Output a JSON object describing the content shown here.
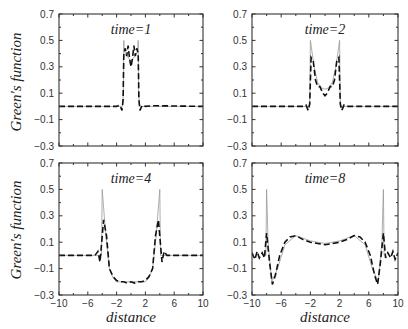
{
  "chart_data": [
    {
      "type": "line",
      "title": "time=1",
      "xlabel": "",
      "ylabel": "Green's function",
      "xlim": [
        -10,
        10
      ],
      "ylim": [
        -0.3,
        0.7
      ],
      "xticks": [
        -10,
        -6,
        -2,
        2,
        6,
        10
      ],
      "yticks": [
        -0.3,
        -0.1,
        0.1,
        0.3,
        0.5,
        0.7
      ],
      "show_xtick_labels": false,
      "show_ytick_labels": true,
      "series": [
        {
          "name": "exact",
          "style": "solid-thin",
          "x": [
            -10,
            -1.2,
            -1.05,
            -1.0,
            -0.95,
            -0.5,
            0,
            0.5,
            0.95,
            1.0,
            1.05,
            1.2,
            10
          ],
          "y": [
            0,
            0,
            0.1,
            0.5,
            0.42,
            0.38,
            0.34,
            0.38,
            0.42,
            0.5,
            0.1,
            0,
            0
          ]
        },
        {
          "name": "approximation",
          "style": "dashed",
          "x": [
            -10,
            -2,
            -1.6,
            -1.4,
            -1.25,
            -1.1,
            -1.0,
            -0.8,
            -0.6,
            -0.4,
            -0.2,
            0,
            0.2,
            0.4,
            0.6,
            0.8,
            1.0,
            1.1,
            1.25,
            1.4,
            1.6,
            2,
            3,
            10
          ],
          "y": [
            0,
            0,
            0.01,
            -0.01,
            -0.03,
            0.05,
            0.4,
            0.44,
            0.38,
            0.46,
            0.36,
            0.3,
            0.36,
            0.46,
            0.38,
            0.44,
            0.4,
            0.05,
            -0.03,
            -0.01,
            0.01,
            0,
            0.005,
            0
          ]
        }
      ]
    },
    {
      "type": "line",
      "title": "time=2",
      "xlabel": "",
      "ylabel": "",
      "xlim": [
        -10,
        10
      ],
      "ylim": [
        -0.3,
        0.7
      ],
      "xticks": [
        -10,
        -6,
        -2,
        2,
        6,
        10
      ],
      "yticks": [
        -0.3,
        -0.1,
        0.1,
        0.3,
        0.5,
        0.7
      ],
      "show_xtick_labels": false,
      "show_ytick_labels": true,
      "series": [
        {
          "name": "exact",
          "style": "solid-thin",
          "x": [
            -10,
            -2.1,
            -2.0,
            -1.5,
            -1,
            -0.5,
            0,
            0.5,
            1,
            1.5,
            2.0,
            2.1,
            10
          ],
          "y": [
            0,
            0,
            0.5,
            0.3,
            0.18,
            0.14,
            0.13,
            0.14,
            0.18,
            0.3,
            0.5,
            0,
            0
          ]
        },
        {
          "name": "approximation",
          "style": "dashed",
          "x": [
            -10,
            -3,
            -2.6,
            -2.3,
            -2.1,
            -1.9,
            -1.6,
            -1.3,
            -1,
            -0.7,
            -0.3,
            0,
            0.3,
            0.7,
            1,
            1.3,
            1.6,
            1.9,
            2.1,
            2.3,
            2.6,
            3,
            10
          ],
          "y": [
            0,
            0,
            0.01,
            -0.03,
            0.02,
            0.37,
            0.34,
            0.2,
            0.15,
            0.15,
            0.1,
            0.08,
            0.1,
            0.15,
            0.15,
            0.2,
            0.34,
            0.37,
            0.02,
            -0.03,
            0.01,
            0,
            0
          ]
        }
      ]
    },
    {
      "type": "line",
      "title": "time=4",
      "xlabel": "distance",
      "ylabel": "Green's function",
      "xlim": [
        -10,
        10
      ],
      "ylim": [
        -0.3,
        0.7
      ],
      "xticks": [
        -10,
        -6,
        -2,
        2,
        6,
        10
      ],
      "yticks": [
        -0.3,
        -0.1,
        0.1,
        0.3,
        0.5,
        0.7
      ],
      "show_xtick_labels": true,
      "show_ytick_labels": true,
      "series": [
        {
          "name": "exact",
          "style": "solid-thin",
          "x": [
            -10,
            -4.1,
            -4.0,
            -3.5,
            -3,
            -2.5,
            -2,
            0,
            2,
            2.5,
            3,
            3.5,
            4.0,
            4.1,
            10
          ],
          "y": [
            0,
            0,
            0.5,
            0.15,
            -0.1,
            -0.17,
            -0.2,
            -0.2,
            -0.2,
            -0.17,
            -0.1,
            0.15,
            0.5,
            0,
            0
          ]
        },
        {
          "name": "approximation",
          "style": "dashed",
          "x": [
            -10,
            -5,
            -4.6,
            -4.3,
            -3.8,
            -3.4,
            -3,
            -2.5,
            -2,
            -1.5,
            -1,
            -0.5,
            0,
            0.5,
            1,
            1.5,
            2,
            2.5,
            3,
            3.4,
            3.8,
            4.3,
            4.6,
            5,
            10
          ],
          "y": [
            0,
            0,
            0.03,
            -0.05,
            0.27,
            0.15,
            -0.1,
            -0.16,
            -0.19,
            -0.2,
            -0.2,
            -0.21,
            -0.2,
            -0.21,
            -0.2,
            -0.2,
            -0.19,
            -0.16,
            -0.1,
            0.15,
            0.27,
            -0.05,
            0.03,
            0,
            0
          ]
        }
      ]
    },
    {
      "type": "line",
      "title": "time=8",
      "xlabel": "distance",
      "ylabel": "",
      "xlim": [
        -10,
        10
      ],
      "ylim": [
        -0.3,
        0.7
      ],
      "xticks": [
        -10,
        -6,
        -2,
        2,
        6,
        10
      ],
      "yticks": [
        -0.3,
        -0.1,
        0.1,
        0.3,
        0.5,
        0.7
      ],
      "show_xtick_labels": true,
      "show_ytick_labels": true,
      "series": [
        {
          "name": "exact",
          "style": "solid-thin",
          "x": [
            -8.1,
            -8.0,
            -7.8,
            -7.3,
            -6.5,
            -5.5,
            -4,
            -2,
            0,
            2,
            4,
            5.5,
            6.5,
            7.3,
            7.8,
            8.0,
            8.1
          ],
          "y": [
            0,
            0.5,
            0.1,
            -0.2,
            -0.1,
            0.08,
            0.15,
            0.11,
            0.09,
            0.11,
            0.15,
            0.08,
            -0.1,
            -0.2,
            0.1,
            0.5,
            0
          ]
        },
        {
          "name": "approximation",
          "style": "dashed",
          "x": [
            -10,
            -9.6,
            -9.3,
            -9,
            -8.6,
            -8.3,
            -8.0,
            -7.6,
            -7.2,
            -6.8,
            -6.2,
            -5.5,
            -4.8,
            -4,
            -3,
            -2,
            -1,
            0,
            1,
            2,
            3,
            4,
            4.8,
            5.5,
            6.2,
            6.8,
            7.2,
            7.6,
            8.0,
            8.3,
            8.6,
            9,
            9.3,
            9.6,
            10
          ],
          "y": [
            0.02,
            -0.03,
            0.03,
            -0.02,
            0.02,
            -0.02,
            0.17,
            -0.05,
            -0.22,
            -0.15,
            0.0,
            0.1,
            0.14,
            0.15,
            0.12,
            0.1,
            0.09,
            0.08,
            0.09,
            0.1,
            0.12,
            0.15,
            0.14,
            0.1,
            0.0,
            -0.15,
            -0.22,
            -0.05,
            0.17,
            -0.02,
            0.02,
            -0.02,
            0.03,
            -0.03,
            0.02
          ]
        }
      ]
    }
  ],
  "labels": {
    "ylabel_top": "Green's function",
    "ylabel_bottom": "Green's function",
    "xlabel_left": "distance",
    "xlabel_right": "distance"
  }
}
